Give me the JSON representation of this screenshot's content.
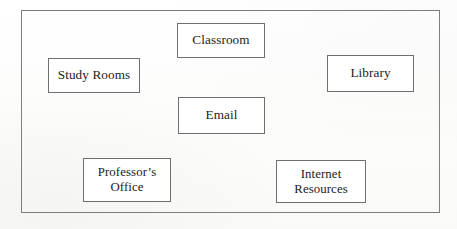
{
  "diagram": {
    "background_color": "#fdfdfc",
    "frame": {
      "name": "outer-frame",
      "border_color": "#7e7e7e",
      "x": 21,
      "y": 10,
      "width": 419,
      "height": 203
    },
    "node_border_color": "#6f6f6f",
    "node_fill_color": "#ffffff",
    "text_color": "#1b1b1b",
    "nodes": [
      {
        "id": "classroom",
        "label": "Classroom",
        "x": 177,
        "y": 23,
        "width": 88,
        "height": 35,
        "lines": 1
      },
      {
        "id": "study-rooms",
        "label": "Study Rooms",
        "x": 48,
        "y": 58,
        "width": 92,
        "height": 35,
        "lines": 1
      },
      {
        "id": "library",
        "label": "Library",
        "x": 327,
        "y": 55,
        "width": 87,
        "height": 37,
        "lines": 1
      },
      {
        "id": "email",
        "label": "Email",
        "x": 178,
        "y": 97,
        "width": 87,
        "height": 37,
        "lines": 1
      },
      {
        "id": "professors-office",
        "label": "Professor’s\nOffice",
        "x": 83,
        "y": 158,
        "width": 88,
        "height": 44,
        "lines": 2
      },
      {
        "id": "internet-resources",
        "label": "Internet\nResources",
        "x": 276,
        "y": 160,
        "width": 90,
        "height": 43,
        "lines": 2
      }
    ]
  }
}
